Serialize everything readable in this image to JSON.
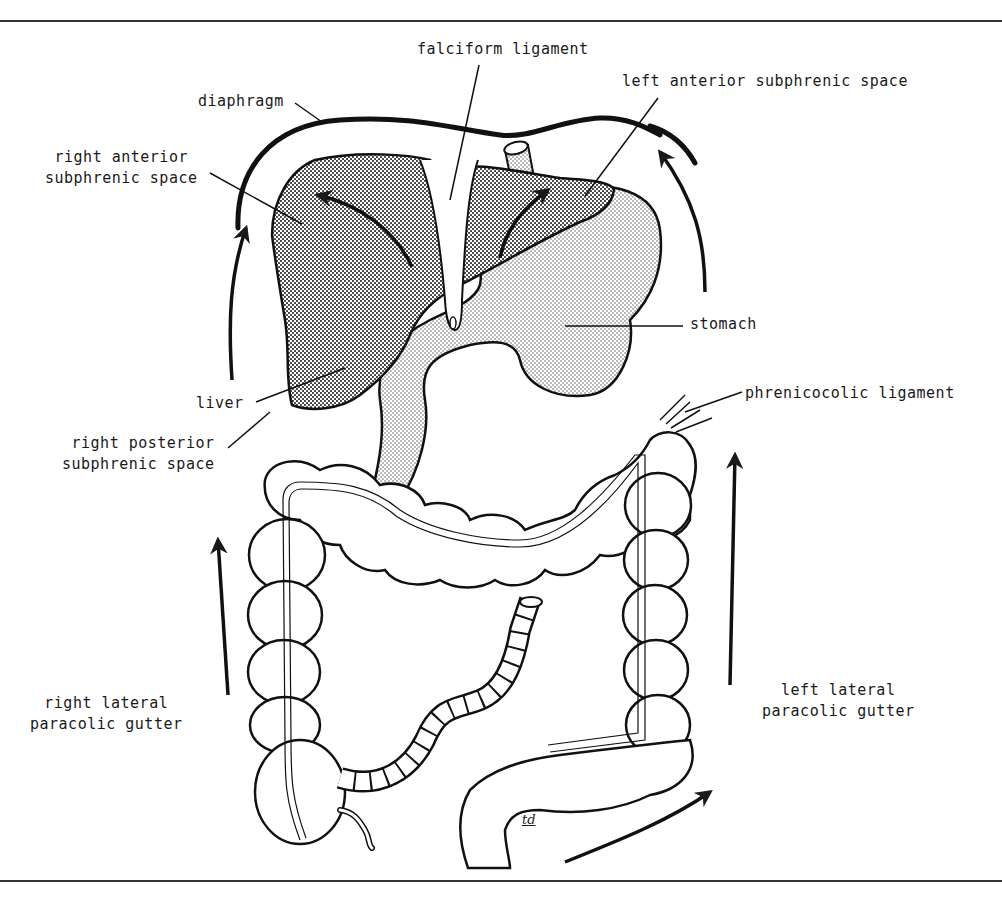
{
  "figure": {
    "colors": {
      "ink": "#1a1a1a",
      "liver_fill": "#b8b8b8",
      "stomach_fill": "#d6d6d6",
      "background": "#ffffff"
    },
    "artist_signature": "td"
  },
  "labels": {
    "falciform_ligament": "falciform ligament",
    "diaphragm": "diaphragm",
    "left_anterior_subphrenic_space": "left anterior subphrenic space",
    "right_anterior_subphrenic_space": "right anterior\nsubphrenic space",
    "stomach": "stomach",
    "liver": "liver",
    "right_posterior_subphrenic_space": "right posterior\nsubphrenic space",
    "phrenicocolic_ligament": "phrenicocolic ligament",
    "right_lateral_paracolic_gutter": "right lateral\nparacolic gutter",
    "left_lateral_paracolic_gutter": "left lateral\nparacolic gutter"
  },
  "structures": [
    "diaphragm",
    "liver",
    "falciform ligament",
    "stomach",
    "esophagus",
    "transverse colon",
    "ascending colon",
    "descending colon",
    "cecum",
    "appendix",
    "small intestine (cut)",
    "sigmoid colon",
    "phrenicocolic ligament"
  ],
  "flow_arrows": [
    {
      "location": "right lateral paracolic gutter",
      "direction": "up"
    },
    {
      "location": "right subphrenic (lateral to liver)",
      "direction": "up"
    },
    {
      "location": "right anterior subphrenic space",
      "direction": "up-left"
    },
    {
      "location": "left anterior subphrenic space",
      "direction": "up-right"
    },
    {
      "location": "left subphrenic (lateral to stomach)",
      "direction": "up"
    },
    {
      "location": "left lateral paracolic gutter",
      "direction": "up"
    },
    {
      "location": "pelvis toward left gutter",
      "direction": "up-right"
    }
  ]
}
